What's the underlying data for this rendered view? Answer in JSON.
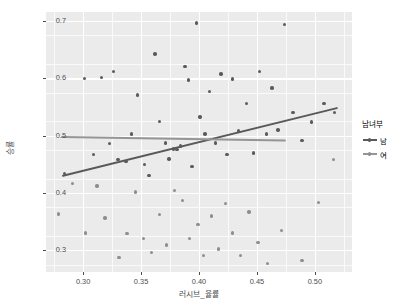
{
  "chart_data": {
    "type": "scatter",
    "title": "",
    "xlabel": "러시브_율률",
    "ylabel": "승률",
    "xlim": [
      0.268,
      0.532
    ],
    "ylim": [
      0.262,
      0.716
    ],
    "grid": true,
    "panel_background": "#ebebeb",
    "grid_color": "#ffffff",
    "legend": {
      "title": "남녀부",
      "position": "right",
      "entries": [
        {
          "label": "남",
          "color": "#5b5b5b"
        },
        {
          "label": "여",
          "color": "#8e8e8e"
        }
      ]
    },
    "xticks": [
      {
        "value": 0.3,
        "label": "0.30"
      },
      {
        "value": 0.35,
        "label": "0.35"
      },
      {
        "value": 0.4,
        "label": "0.40"
      },
      {
        "value": 0.45,
        "label": "0.45"
      },
      {
        "value": 0.5,
        "label": "0.50"
      }
    ],
    "xticks_minor": [
      0.275,
      0.325,
      0.375,
      0.425,
      0.475,
      0.525
    ],
    "yticks": [
      {
        "value": 0.7,
        "label": "0.7"
      },
      {
        "value": 0.6,
        "label": "0.6"
      },
      {
        "value": 0.5,
        "label": "0.5"
      },
      {
        "value": 0.4,
        "label": "0.4"
      },
      {
        "value": 0.3,
        "label": "0.3"
      }
    ],
    "yticks_minor": [
      0.275,
      0.325,
      0.375,
      0.425,
      0.475,
      0.525,
      0.575,
      0.625,
      0.675
    ],
    "series": [
      {
        "name": "남",
        "color": "#5b5b5b",
        "points": [
          [
            0.284,
            0.434
          ],
          [
            0.301,
            0.6
          ],
          [
            0.309,
            0.467
          ],
          [
            0.316,
            0.602
          ],
          [
            0.323,
            0.486
          ],
          [
            0.326,
            0.612
          ],
          [
            0.33,
            0.458
          ],
          [
            0.337,
            0.455
          ],
          [
            0.342,
            0.503
          ],
          [
            0.347,
            0.571
          ],
          [
            0.353,
            0.45
          ],
          [
            0.357,
            0.43
          ],
          [
            0.362,
            0.643
          ],
          [
            0.366,
            0.525
          ],
          [
            0.371,
            0.487
          ],
          [
            0.374,
            0.459
          ],
          [
            0.378,
            0.477
          ],
          [
            0.381,
            0.476
          ],
          [
            0.384,
            0.482
          ],
          [
            0.388,
            0.621
          ],
          [
            0.391,
            0.597
          ],
          [
            0.394,
            0.446
          ],
          [
            0.398,
            0.697
          ],
          [
            0.401,
            0.533
          ],
          [
            0.405,
            0.503
          ],
          [
            0.409,
            0.577
          ],
          [
            0.414,
            0.487
          ],
          [
            0.419,
            0.608
          ],
          [
            0.424,
            0.467
          ],
          [
            0.429,
            0.599
          ],
          [
            0.434,
            0.508
          ],
          [
            0.441,
            0.556
          ],
          [
            0.447,
            0.47
          ],
          [
            0.452,
            0.612
          ],
          [
            0.458,
            0.503
          ],
          [
            0.463,
            0.583
          ],
          [
            0.468,
            0.51
          ],
          [
            0.474,
            0.694
          ],
          [
            0.481,
            0.541
          ],
          [
            0.489,
            0.492
          ],
          [
            0.497,
            0.524
          ],
          [
            0.508,
            0.556
          ],
          [
            0.517,
            0.54
          ]
        ]
      },
      {
        "name": "여",
        "color": "#8e8e8e",
        "points": [
          [
            0.279,
            0.363
          ],
          [
            0.291,
            0.417
          ],
          [
            0.302,
            0.33
          ],
          [
            0.312,
            0.412
          ],
          [
            0.319,
            0.356
          ],
          [
            0.331,
            0.287
          ],
          [
            0.338,
            0.329
          ],
          [
            0.345,
            0.402
          ],
          [
            0.352,
            0.32
          ],
          [
            0.359,
            0.296
          ],
          [
            0.366,
            0.362
          ],
          [
            0.372,
            0.309
          ],
          [
            0.379,
            0.404
          ],
          [
            0.386,
            0.387
          ],
          [
            0.392,
            0.321
          ],
          [
            0.399,
            0.345
          ],
          [
            0.404,
            0.291
          ],
          [
            0.411,
            0.36
          ],
          [
            0.417,
            0.302
          ],
          [
            0.423,
            0.382
          ],
          [
            0.429,
            0.33
          ],
          [
            0.436,
            0.291
          ],
          [
            0.443,
            0.367
          ],
          [
            0.451,
            0.313
          ],
          [
            0.459,
            0.277
          ],
          [
            0.471,
            0.335
          ],
          [
            0.489,
            0.282
          ],
          [
            0.503,
            0.383
          ],
          [
            0.516,
            0.458
          ]
        ]
      }
    ],
    "fit_lines": [
      {
        "name": "남",
        "color": "#595959",
        "x_start": 0.282,
        "y_start": 0.432,
        "x_end": 0.52,
        "y_end": 0.551
      },
      {
        "name": "여",
        "color": "#959595",
        "x_start": 0.281,
        "y_start": 0.5,
        "x_end": 0.475,
        "y_end": 0.494
      }
    ]
  }
}
